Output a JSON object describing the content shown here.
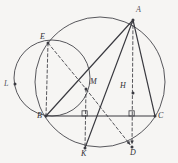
{
  "figure": {
    "background_color": "#f6f5f3",
    "stroke_color": "#3a3a40",
    "points": [
      {
        "id": "A",
        "label": "A",
        "x": 133,
        "y": 20,
        "label_x": 136,
        "label_y": 6,
        "dot": true
      },
      {
        "id": "E",
        "label": "E",
        "x": 48,
        "y": 43,
        "label_x": 40,
        "label_y": 33,
        "dot": true
      },
      {
        "id": "L",
        "label": "L",
        "x": 15,
        "y": 84,
        "label_x": 4,
        "label_y": 80,
        "dot": true
      },
      {
        "id": "M",
        "label": "M",
        "x": 86,
        "y": 89,
        "label_x": 90,
        "label_y": 78,
        "dot": true
      },
      {
        "id": "H",
        "label": "H",
        "x": 133,
        "y": 93,
        "label_x": 120,
        "label_y": 82,
        "dot": true
      },
      {
        "id": "B",
        "label": "B",
        "x": 46,
        "y": 116,
        "label_x": 37,
        "label_y": 112,
        "dot": true
      },
      {
        "id": "C",
        "label": "C",
        "x": 155,
        "y": 116,
        "label_x": 158,
        "label_y": 112,
        "dot": true
      },
      {
        "id": "K",
        "label": "K",
        "x": 85,
        "y": 148,
        "label_x": 81,
        "label_y": 150,
        "dot": true
      },
      {
        "id": "D",
        "label": "D",
        "x": 132,
        "y": 147,
        "label_x": 130,
        "label_y": 149,
        "dot": true
      }
    ],
    "circles": [
      {
        "id": "circumcircle",
        "cx": 100,
        "cy": 82,
        "r": 65,
        "style": "solid"
      },
      {
        "id": "small-circle",
        "cx": 52,
        "cy": 78,
        "r": 38,
        "style": "solid"
      }
    ],
    "solid_segments": [
      {
        "id": "BC",
        "from": "B",
        "to": "C"
      },
      {
        "id": "BA",
        "from": "B",
        "to": "A"
      },
      {
        "id": "AC",
        "from": "A",
        "to": "C"
      },
      {
        "id": "KA",
        "from": "K",
        "to": "A"
      }
    ],
    "dashed_segments": [
      {
        "id": "EB",
        "from": "E",
        "to": "B"
      },
      {
        "id": "EM",
        "from": "E",
        "to": "M"
      },
      {
        "id": "MK",
        "from": "M",
        "to": "K"
      },
      {
        "id": "MD",
        "from": "M",
        "to": "D",
        "arrow": true
      },
      {
        "id": "AD",
        "from": "A",
        "to": "D",
        "arrow": true
      }
    ],
    "right_angle_marks": [
      {
        "id": "at-foot-K",
        "x": 85,
        "y": 116
      },
      {
        "id": "at-foot-D",
        "x": 132,
        "y": 116
      }
    ]
  }
}
